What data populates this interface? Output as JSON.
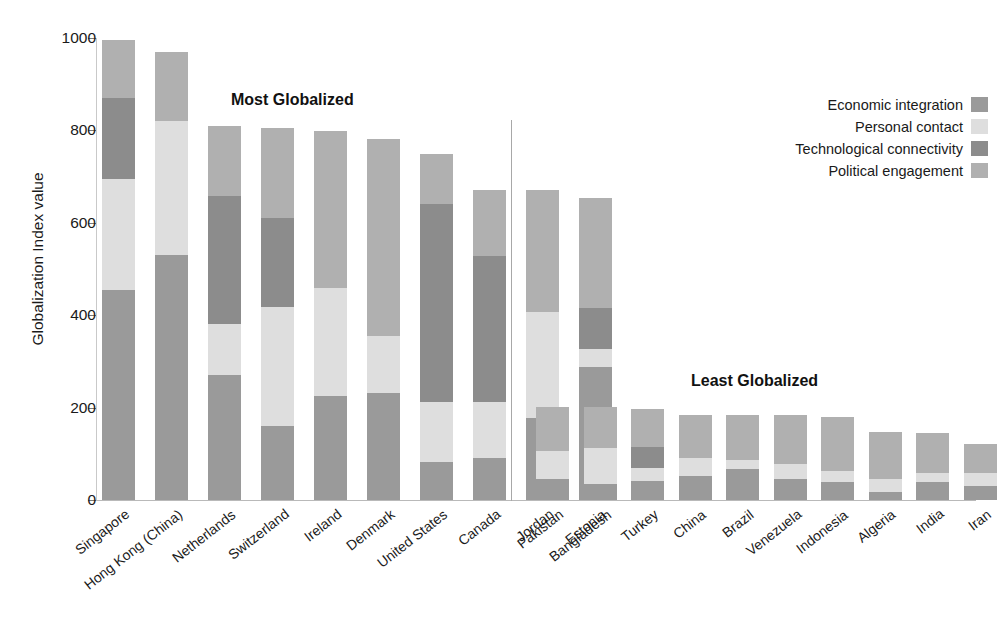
{
  "chart_data": {
    "type": "bar",
    "subtype": "stacked-bar",
    "title": "",
    "xlabel": "",
    "ylabel": "Globalization Index value",
    "ylim": [
      0,
      1000
    ],
    "yticks": [
      0,
      200,
      400,
      600,
      800,
      1000
    ],
    "grid": false,
    "legend_position": "top-right",
    "categories": [
      "Singapore",
      "Hong Kong (China)",
      "Netherlands",
      "Switzerland",
      "Ireland",
      "Denmark",
      "United States",
      "Canada",
      "Jordan",
      "Estonia",
      "Pakistan",
      "Bangladesh",
      "Turkey",
      "China",
      "Brazil",
      "Venezuela",
      "Indonesia",
      "Algeria",
      "India",
      "Iran"
    ],
    "series": [
      {
        "name": "Economic integration",
        "color": "#9a9a9a",
        "values": [
          455,
          530,
          270,
          160,
          225,
          232,
          82,
          90,
          178,
          288,
          45,
          35,
          42,
          52,
          68,
          45,
          40,
          18,
          40,
          30
        ]
      },
      {
        "name": "Personal contact",
        "color": "#dedede",
        "values": [
          240,
          290,
          112,
          258,
          235,
          122,
          130,
          122,
          228,
          38,
          62,
          78,
          28,
          38,
          18,
          34,
          22,
          28,
          18,
          28
        ]
      },
      {
        "name": "Technological connectivity",
        "color": "#8c8c8c",
        "values": [
          175,
          0,
          275,
          192,
          0,
          0,
          428,
          316,
          0,
          90,
          0,
          0,
          44,
          0,
          0,
          0,
          0,
          0,
          0,
          0
        ]
      },
      {
        "name": "Political engagement",
        "color": "#b0b0b0",
        "values": [
          125,
          150,
          152,
          195,
          338,
          428,
          110,
          144,
          264,
          238,
          95,
          89,
          84,
          95,
          98,
          104,
          117,
          101,
          88,
          64
        ]
      }
    ],
    "totals": [
      995,
      970,
      809,
      805,
      798,
      782,
      750,
      672,
      670,
      654,
      202,
      202,
      198,
      185,
      184,
      183,
      179,
      147,
      146,
      122
    ],
    "stack_order_bottom_to_top": [
      "Economic integration",
      "Personal contact",
      "Technological connectivity",
      "Political engagement"
    ],
    "annotations": [
      {
        "text": "Most Globalized",
        "group": "left"
      },
      {
        "text": "Least Globalized",
        "group": "right"
      }
    ]
  },
  "axis": {
    "y_label": "Globalization Index value",
    "y_ticks": [
      "0",
      "200",
      "400",
      "600",
      "800",
      "1000"
    ]
  },
  "annotations": {
    "most": "Most Globalized",
    "least": "Least Globalized"
  },
  "legend": {
    "items": [
      {
        "label": "Economic integration",
        "color": "#9a9a9a"
      },
      {
        "label": "Personal contact",
        "color": "#dedede"
      },
      {
        "label": "Technological connectivity",
        "color": "#8c8c8c"
      },
      {
        "label": "Political engagement",
        "color": "#b0b0b0"
      }
    ]
  }
}
